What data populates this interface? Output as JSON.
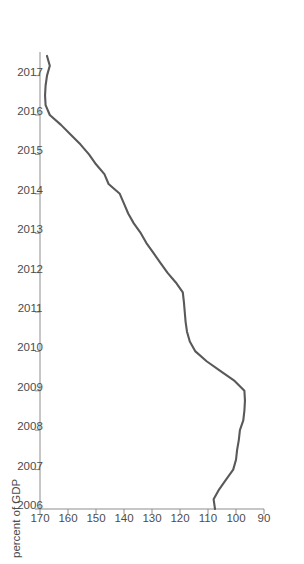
{
  "chart_data": {
    "type": "line",
    "title": "",
    "subtitle": "",
    "xlabel": "",
    "ylabel": "percent of GDP",
    "orientation": "rotated-90",
    "grid": false,
    "legend": null,
    "line_color": "#595959",
    "axis_color": "#8d8d8d",
    "text_color": "#4c4c4c",
    "background": "#ffffff",
    "xlim": [
      2006,
      2017.6
    ],
    "ylim": [
      90,
      170
    ],
    "x_ticks": [
      "2006",
      "2007",
      "2008",
      "2009",
      "2010",
      "2011",
      "2012",
      "2013",
      "2014",
      "2015",
      "2016",
      "2017"
    ],
    "y_ticks": [
      "170",
      "160",
      "150",
      "140",
      "130",
      "120",
      "110",
      "100",
      "90"
    ],
    "y_tick_values": [
      170,
      160,
      150,
      140,
      130,
      120,
      110,
      100,
      90
    ],
    "x": [
      2006.0,
      2006.25,
      2006.5,
      2006.75,
      2007.0,
      2007.25,
      2007.5,
      2007.75,
      2008.0,
      2008.25,
      2008.5,
      2008.75,
      2009.0,
      2009.25,
      2009.5,
      2009.75,
      2010.0,
      2010.25,
      2010.5,
      2010.75,
      2011.0,
      2011.25,
      2011.5,
      2011.75,
      2012.0,
      2012.25,
      2012.5,
      2012.75,
      2013.0,
      2013.25,
      2013.5,
      2013.75,
      2014.0,
      2014.25,
      2014.5,
      2014.75,
      2015.0,
      2015.25,
      2015.5,
      2015.75,
      2016.0,
      2016.25,
      2016.5,
      2016.75,
      2017.0,
      2017.25,
      2017.5
    ],
    "values": [
      107.5,
      108.0,
      106.0,
      103.5,
      101.0,
      100.0,
      99.6,
      99.0,
      98.6,
      97.4,
      97.0,
      96.8,
      97.0,
      100.5,
      105.5,
      110.5,
      114.5,
      116.5,
      117.5,
      118.0,
      118.3,
      118.6,
      119.0,
      121.5,
      124.5,
      127.0,
      129.5,
      132.0,
      134.0,
      136.5,
      138.5,
      140.0,
      141.5,
      145.5,
      147.0,
      150.0,
      152.5,
      155.5,
      159.0,
      162.5,
      166.5,
      168.0,
      168.2,
      168.0,
      167.5,
      166.5,
      167.5
    ],
    "series": [
      {
        "name": "percent of GDP",
        "color": "#595959",
        "values": [
          107.5,
          108.0,
          106.0,
          103.5,
          101.0,
          100.0,
          99.6,
          99.0,
          98.6,
          97.4,
          97.0,
          96.8,
          97.0,
          100.5,
          105.5,
          110.5,
          114.5,
          116.5,
          117.5,
          118.0,
          118.3,
          118.6,
          119.0,
          121.5,
          124.5,
          127.0,
          129.5,
          132.0,
          134.0,
          136.5,
          138.5,
          140.0,
          141.5,
          145.5,
          147.0,
          150.0,
          152.5,
          155.5,
          159.0,
          162.5,
          166.5,
          168.0,
          168.2,
          168.0,
          167.5,
          166.5,
          167.5
        ]
      }
    ],
    "annotations": []
  }
}
